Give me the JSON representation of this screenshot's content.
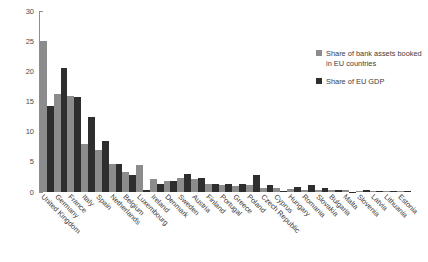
{
  "chart_data": {
    "type": "bar",
    "title": "",
    "xlabel": "",
    "ylabel": "",
    "ylim": [
      0,
      30
    ],
    "yticks": [
      0,
      5,
      10,
      15,
      20,
      25,
      30
    ],
    "grid": false,
    "legend_position": "right",
    "categories": [
      "United Kingdom",
      "Germany",
      "France",
      "Italy",
      "Spain",
      "Netherlands",
      "Belgium",
      "Luxembourg",
      "Ireland",
      "Denmark",
      "Sweden",
      "Austria",
      "Finland",
      "Portugal",
      "Greece",
      "Poland",
      "Czech Republic",
      "Cyprus",
      "Hungary",
      "Romania",
      "Slovakia",
      "Bulgaria",
      "Malta",
      "Slovenia",
      "Latvia",
      "Lithuania",
      "Estonia"
    ],
    "series": [
      {
        "name": "Share of bank assets booked in EU countries",
        "color": "#8c8c8c",
        "values": [
          25.0,
          16.2,
          15.9,
          8.0,
          7.0,
          4.7,
          3.3,
          4.4,
          2.1,
          1.9,
          2.4,
          2.2,
          1.4,
          1.1,
          1.0,
          1.2,
          0.7,
          0.6,
          0.5,
          0.4,
          0.35,
          0.3,
          0.3,
          0.25,
          0.2,
          0.2,
          0.15
        ]
      },
      {
        "name": "Share of EU GDP",
        "color": "#2e2e2e",
        "values": [
          14.3,
          20.5,
          15.8,
          12.4,
          8.4,
          4.6,
          2.8,
          0.4,
          1.3,
          1.8,
          3.0,
          2.3,
          1.4,
          1.3,
          1.3,
          2.8,
          1.2,
          0.15,
          0.8,
          1.1,
          0.6,
          0.3,
          0.06,
          0.3,
          0.15,
          0.25,
          0.12
        ]
      }
    ]
  },
  "legend": {
    "entries": [
      {
        "label": "Share of bank assets booked in EU countries",
        "swatch": "s1"
      },
      {
        "label": "Share of EU GDP",
        "swatch": "s2"
      }
    ]
  },
  "axis": {
    "y_tick_labels": [
      "0",
      "5",
      "10",
      "15",
      "20",
      "25",
      "30"
    ]
  }
}
